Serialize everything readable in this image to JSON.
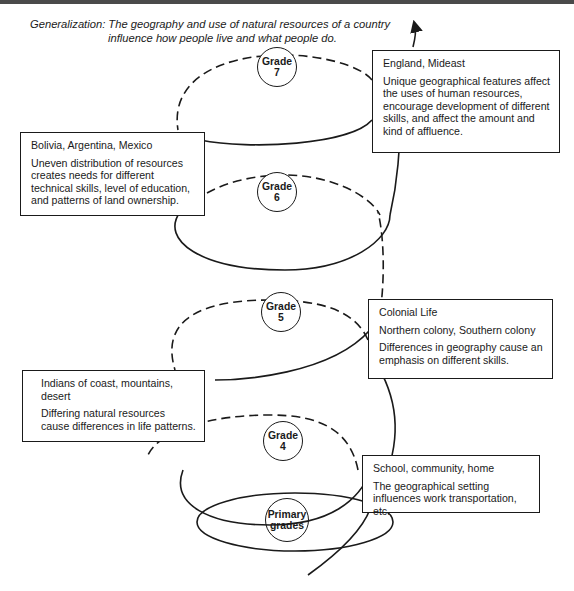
{
  "generalization": {
    "label": "Generalization:",
    "line1": "The geography and use of natural resources of a country",
    "line2": "influence how people live and what people do."
  },
  "grades": [
    {
      "id": "primary",
      "label": "Primary grades"
    },
    {
      "id": "grade4",
      "label": "Grade 4"
    },
    {
      "id": "grade5",
      "label": "Grade 5"
    },
    {
      "id": "grade6",
      "label": "Grade 6"
    },
    {
      "id": "grade7",
      "label": "Grade 7"
    }
  ],
  "boxes": {
    "primary": {
      "title": "School, community, home",
      "desc": "The geographical setting influences work transportation, etc."
    },
    "grade4": {
      "title": "Indians of coast, mountains, desert",
      "desc": "Differing natural resources cause differences in life patterns."
    },
    "grade5": {
      "title": "Colonial Life",
      "subtitle": "Northern colony, Southern colony",
      "desc": "Differences in geography cause an emphasis on different skills."
    },
    "grade6": {
      "title": "Bolivia, Argentina, Mexico",
      "desc": "Uneven distribution of resources creates needs for different technical skills, level of education, and patterns of land ownership."
    },
    "grade7": {
      "title": "England, Mideast",
      "desc": "Unique geographical features affect the uses of human resources, encourage development of different skills, and affect the amount and kind of affluence."
    }
  },
  "colors": {
    "ink": "#1a1a1a",
    "paper": "#ffffff",
    "strip": "#4a4a4a"
  }
}
